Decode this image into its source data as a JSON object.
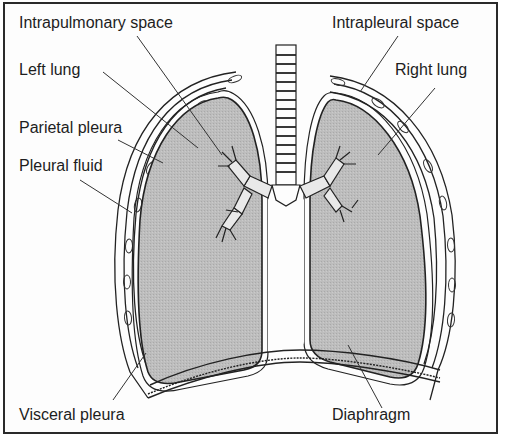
{
  "diagram": {
    "type": "anatomical-diagram",
    "labels": {
      "intrapulmonary_space": "Intrapulmonary space",
      "left_lung": "Left lung",
      "parietal_pleura": "Parietal pleura",
      "pleural_fluid": "Pleural fluid",
      "intrapleural_space": "Intrapleural space",
      "right_lung": "Right lung",
      "visceral_pleura": "Visceral pleura",
      "diaphragm": "Diaphragm"
    },
    "colors": {
      "lung_fill": "#b9b9b9",
      "line": "#222222",
      "background": "#fdfdfd",
      "border": "#2a2a2a"
    }
  }
}
